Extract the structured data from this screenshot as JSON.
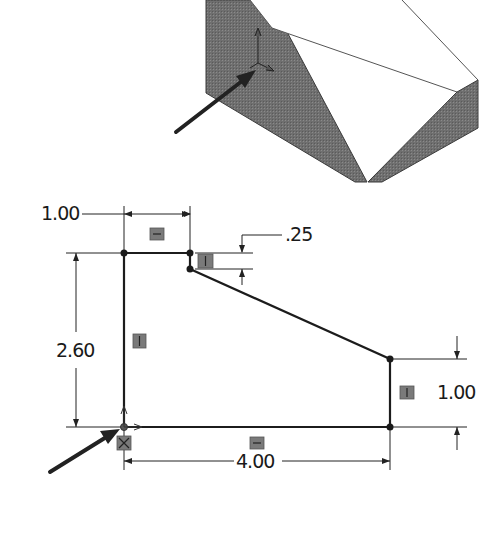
{
  "figure": {
    "iso_view": {
      "description": "Isometric 3D view of extruded part with origin triad",
      "colors": {
        "shaded_face": "#6e6e6e",
        "edge": "#444444",
        "background": "#ffffff"
      },
      "arrow": {
        "points_to": "origin"
      }
    },
    "sketch": {
      "dimensions": {
        "top_width": "1.00",
        "step_height": ".25",
        "overall_height": "2.60",
        "right_height": "1.00",
        "overall_width": "4.00"
      },
      "relations": [
        {
          "name": "horizontal-top",
          "type": "horizontal"
        },
        {
          "name": "vertical-step",
          "type": "vertical"
        },
        {
          "name": "vertical-left",
          "type": "vertical"
        },
        {
          "name": "vertical-right",
          "type": "vertical"
        },
        {
          "name": "horizontal-bottom",
          "type": "horizontal"
        },
        {
          "name": "coincident-origin",
          "type": "coincident"
        }
      ],
      "arrow": {
        "points_to": "origin"
      }
    }
  }
}
